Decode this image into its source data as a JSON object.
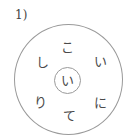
{
  "puzzle": {
    "number_label": "1)",
    "center_char": "い",
    "ring_chars": [
      {
        "position": "top",
        "char": "こ",
        "x": 67,
        "y": 47
      },
      {
        "position": "upper-right",
        "char": "い",
        "x": 100,
        "y": 61
      },
      {
        "position": "lower-right",
        "char": "に",
        "x": 100,
        "y": 102
      },
      {
        "position": "bottom",
        "char": "て",
        "x": 69,
        "y": 115
      },
      {
        "position": "lower-left",
        "char": "り",
        "x": 40,
        "y": 102
      },
      {
        "position": "upper-left",
        "char": "し",
        "x": 42,
        "y": 62
      }
    ]
  }
}
